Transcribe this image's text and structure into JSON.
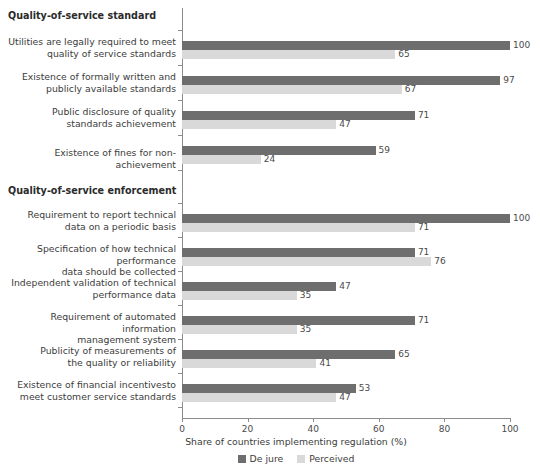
{
  "chart_data": {
    "type": "bar",
    "orientation": "horizontal",
    "title": "",
    "xlabel": "Share of countries implementing regulation (%)",
    "ylabel": "",
    "xlim": [
      0,
      100
    ],
    "xticks": [
      0,
      20,
      40,
      60,
      80,
      100
    ],
    "grid": false,
    "legend_position": "bottom",
    "series": [
      {
        "name": "De jure",
        "color": "#6e6e6e",
        "values": [
          100,
          97,
          71,
          59,
          100,
          71,
          47,
          71,
          65,
          53
        ]
      },
      {
        "name": "Perceived",
        "color": "#d9d9d9",
        "values": [
          65,
          67,
          47,
          24,
          71,
          76,
          35,
          35,
          41,
          47
        ]
      }
    ],
    "categories": [
      "Utilities are legally required to meet\nquality of service standards",
      "Existence of formally written and\npublicly available standards",
      "Public disclosure of quality\nstandards achievement",
      "Existence of fines for non-achievement",
      "Requirement to report technical\ndata on a periodic basis",
      "Specification of how technical performance\ndata should be collected",
      "Independent validation of technical\nperformance data",
      "Requirement of automated information\nmanagement system",
      "Publicity of measurements of\nthe quality or reliability",
      "Existence of financial incentivesto\nmeet customer service standards"
    ],
    "groups": [
      {
        "header": "Quality-of-service standard",
        "category_indices": [
          0,
          1,
          2,
          3
        ]
      },
      {
        "header": "Quality-of-service enforcement",
        "category_indices": [
          4,
          5,
          6,
          7,
          8,
          9
        ]
      }
    ]
  },
  "layout": {
    "group_headers": [
      {
        "label": "Quality-of-service standard",
        "y": 10
      },
      {
        "label": "Quality-of-service enforcement",
        "y": 185
      }
    ],
    "category_rows": [
      {
        "label": "Utilities are legally required to meet\nquality of service standards",
        "dark_y": 41,
        "light_y": 50,
        "label_y": 36
      },
      {
        "label": "Existence of formally written and\npublicly available standards",
        "dark_y": 76,
        "light_y": 85,
        "label_y": 71
      },
      {
        "label": "Public disclosure of quality\nstandards achievement",
        "dark_y": 111,
        "light_y": 120,
        "label_y": 106
      },
      {
        "label": "Existence of fines for non-achievement",
        "dark_y": 146,
        "light_y": 155,
        "label_y": 147
      },
      {
        "label": "Requirement to report technical\ndata on a periodic basis",
        "dark_y": 214,
        "light_y": 223,
        "label_y": 209
      },
      {
        "label": "Specification of how technical performance\ndata should be collected",
        "dark_y": 248,
        "light_y": 257,
        "label_y": 243
      },
      {
        "label": "Independent validation of technical\nperformance data",
        "dark_y": 282,
        "light_y": 291,
        "label_y": 277
      },
      {
        "label": "Requirement of automated information\nmanagement system",
        "dark_y": 316,
        "light_y": 325,
        "label_y": 311
      },
      {
        "label": "Publicity of measurements of\nthe quality or reliability",
        "dark_y": 350,
        "light_y": 359,
        "label_y": 345
      },
      {
        "label": "Existence of financial incentivesto\nmeet customer service standards",
        "dark_y": 384,
        "light_y": 393,
        "label_y": 379
      }
    ],
    "ytick_y": [
      30,
      65,
      100,
      135,
      170,
      203,
      237,
      271,
      305,
      339,
      373,
      407
    ]
  },
  "axis": {
    "title": "Share of countries implementing regulation (%)",
    "tick_labels": [
      "0",
      "20",
      "40",
      "60",
      "80",
      "100"
    ]
  },
  "legend": {
    "items": [
      {
        "label": "De jure",
        "swatch": "de-jure"
      },
      {
        "label": "Perceived",
        "swatch": "perceived"
      }
    ]
  }
}
